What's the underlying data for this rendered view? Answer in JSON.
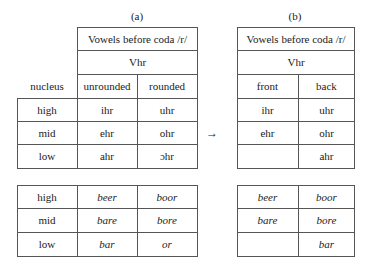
{
  "panel_a": {
    "label": "(a)",
    "header": "Vowels before coda /r/",
    "subheader": "Vhr",
    "row_header_label": "nucleus",
    "columns": [
      "unrounded",
      "rounded"
    ],
    "rows": [
      {
        "nucleus": "high",
        "unrounded": "ihr",
        "rounded": "uhr"
      },
      {
        "nucleus": "mid",
        "unrounded": "ehr",
        "rounded": "ohr"
      },
      {
        "nucleus": "low",
        "unrounded": "ahr",
        "rounded": "ɔhr"
      }
    ],
    "examples": [
      {
        "nucleus": "high",
        "unrounded": "beer",
        "rounded": "boor"
      },
      {
        "nucleus": "mid",
        "unrounded": "bare",
        "rounded": "bore"
      },
      {
        "nucleus": "low",
        "unrounded": "bar",
        "rounded": "or"
      }
    ]
  },
  "arrow": "→",
  "panel_b": {
    "label": "(b)",
    "header": "Vowels before coda /r/",
    "subheader": "Vhr",
    "columns": [
      "front",
      "back"
    ],
    "rows": [
      {
        "front": "ihr",
        "back": "uhr"
      },
      {
        "front": "ehr",
        "back": "ohr"
      },
      {
        "front": "",
        "back": "ahr"
      }
    ],
    "examples": [
      {
        "front": "beer",
        "back": "boor"
      },
      {
        "front": "bare",
        "back": "bore"
      },
      {
        "front": "",
        "back": "bar"
      }
    ]
  }
}
